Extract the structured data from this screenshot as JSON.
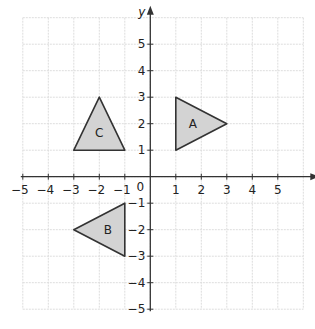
{
  "diagram": {
    "type": "coordinate-grid",
    "axes": {
      "x_label": "x",
      "y_label": "y",
      "origin_label": "0",
      "x_ticks": [
        "-5",
        "-4",
        "-3",
        "-2",
        "-1",
        "1",
        "2",
        "3",
        "4",
        "5"
      ],
      "y_ticks": [
        "5",
        "4",
        "3",
        "2",
        "1",
        "-1",
        "-2",
        "-3",
        "-4",
        "-5"
      ],
      "x_range": [
        -5,
        6
      ],
      "y_range": [
        -5,
        6
      ]
    },
    "shapes": [
      {
        "label": "A",
        "vertices": [
          [
            1,
            1
          ],
          [
            1,
            3
          ],
          [
            3,
            2
          ]
        ]
      },
      {
        "label": "B",
        "vertices": [
          [
            -1,
            -1
          ],
          [
            -1,
            -3
          ],
          [
            -3,
            -2
          ]
        ]
      },
      {
        "label": "C",
        "vertices": [
          [
            -3,
            1
          ],
          [
            -1,
            1
          ],
          [
            -2,
            3
          ]
        ]
      }
    ],
    "colors": {
      "fill": "#d3d3d3",
      "stroke": "#333333",
      "grid": "#dddddd"
    }
  }
}
